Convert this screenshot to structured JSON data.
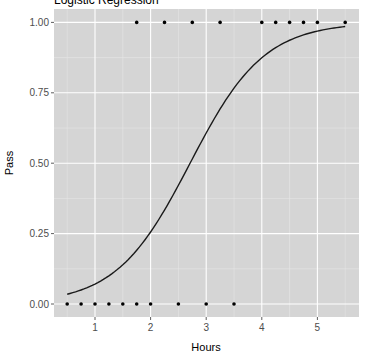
{
  "chart_data": {
    "type": "scatter",
    "title": "Logistic Regression",
    "xlabel": "Hours",
    "ylabel": "Pass",
    "xlim": [
      0.27,
      5.76
    ],
    "ylim": [
      -0.05,
      1.05
    ],
    "x_ticks": [
      1,
      2,
      3,
      4,
      5
    ],
    "x_tick_labels": [
      "1",
      "2",
      "3",
      "4",
      "5"
    ],
    "y_ticks": [
      0,
      0.25,
      0.5,
      0.75,
      1.0
    ],
    "y_tick_labels": [
      "0.00",
      "0.25",
      "0.50",
      "0.75",
      "1.00"
    ],
    "grid": true,
    "legend": null,
    "series": [
      {
        "name": "observations",
        "kind": "points",
        "x": [
          0.5,
          0.75,
          1.0,
          1.25,
          1.5,
          1.75,
          1.75,
          2.0,
          2.25,
          2.5,
          2.75,
          3.0,
          3.25,
          3.5,
          4.0,
          4.25,
          4.5,
          4.75,
          5.0,
          5.5
        ],
        "y": [
          0,
          0,
          0,
          0,
          0,
          0,
          1,
          0,
          1,
          0,
          1,
          0,
          1,
          0,
          1,
          1,
          1,
          1,
          1,
          1
        ]
      },
      {
        "name": "logistic fit",
        "kind": "line",
        "intercept": -4.0777,
        "slope": 1.5046,
        "x": [
          0.5,
          1.0,
          1.5,
          2.0,
          2.5,
          3.0,
          3.5,
          4.0,
          4.5,
          5.0,
          5.5
        ],
        "y": [
          0.035,
          0.07,
          0.14,
          0.26,
          0.42,
          0.61,
          0.77,
          0.87,
          0.94,
          0.97,
          0.985
        ]
      }
    ]
  },
  "colors": {
    "panel": "#d5d5d5",
    "grid_major": "#ffffff",
    "grid_minor": "#e6e6e6",
    "point": "#000000",
    "line": "#1a1a1a"
  }
}
